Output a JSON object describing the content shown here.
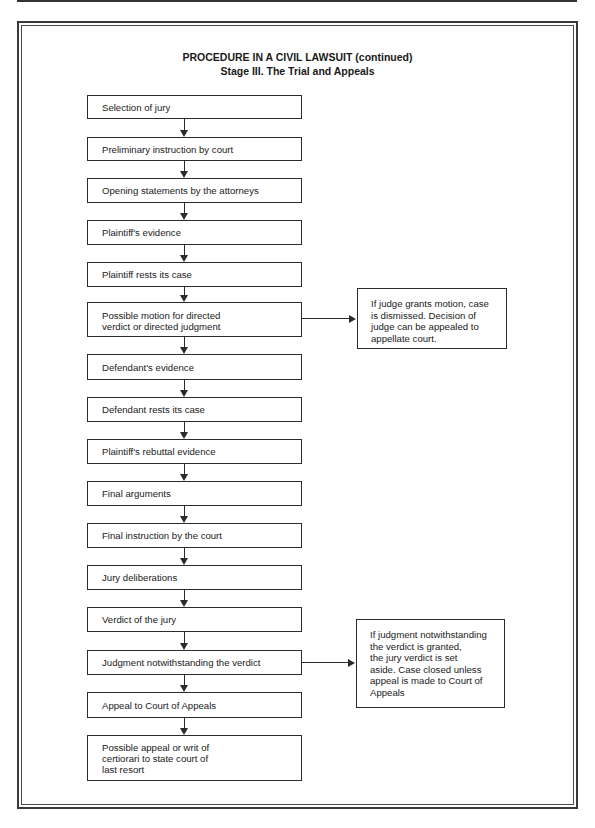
{
  "header": {
    "title_line1": "PROCEDURE IN A CIVIL LAWSUIT (continued)",
    "title_line2": "Stage III.  The Trial and Appeals"
  },
  "steps": [
    {
      "label": "Selection of jury"
    },
    {
      "label": "Preliminary instruction by court"
    },
    {
      "label": "Opening statements by the attorneys"
    },
    {
      "label": "Plaintiff's evidence"
    },
    {
      "label": "Plaintiff rests its case"
    },
    {
      "label": "Possible motion for directed\nverdict or directed judgment"
    },
    {
      "label": "Defendant's evidence"
    },
    {
      "label": "Defendant rests its case"
    },
    {
      "label": "Plaintiff's rebuttal evidence"
    },
    {
      "label": "Final arguments"
    },
    {
      "label": "Final instruction by the court"
    },
    {
      "label": "Jury deliberations"
    },
    {
      "label": "Verdict of the jury"
    },
    {
      "label": "Judgment notwithstanding the verdict"
    },
    {
      "label": "Appeal to Court of Appeals"
    },
    {
      "label": "Possible appeal or writ of\ncertiorari to state court of\nlast resort"
    }
  ],
  "side_notes": [
    {
      "from_step": 6,
      "label": "If judge grants motion, case\nis dismissed. Decision of\njudge can be appealed to\nappellate court."
    },
    {
      "from_step": 14,
      "label": "If judgment notwithstanding\nthe verdict is granted,\nthe jury verdict is set\naside. Case closed unless\nappeal is made to Court of\nAppeals"
    }
  ]
}
